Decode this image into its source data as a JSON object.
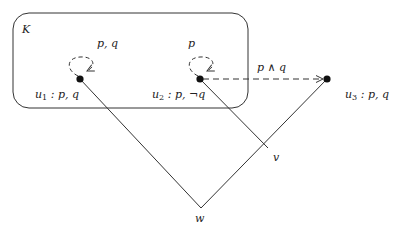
{
  "diagram": {
    "type": "kripke-model",
    "colors": {
      "stroke": "#333333",
      "background": "#ffffff",
      "node": "#111111"
    },
    "region": {
      "label": "K",
      "x": 13,
      "y": 13,
      "w": 235,
      "h": 95,
      "radius": 16
    },
    "nodes": [
      {
        "id": "u1",
        "name": "u",
        "sub": "1",
        "props": ": p, q",
        "x": 80,
        "y": 79,
        "loop_label": "p, q"
      },
      {
        "id": "u2",
        "name": "u",
        "sub": "2",
        "props": ": p, ¬q",
        "x": 200,
        "y": 79,
        "loop_label": "p"
      },
      {
        "id": "u3",
        "name": "u",
        "sub": "3",
        "props": ": p, q",
        "x": 327,
        "y": 79
      },
      {
        "id": "v",
        "name": "v",
        "x": 268,
        "y": 148
      },
      {
        "id": "w",
        "name": "w",
        "x": 201,
        "y": 208
      }
    ],
    "edges": [
      {
        "from": "w",
        "to": "u1",
        "style": "solid"
      },
      {
        "from": "w",
        "to": "u3",
        "style": "solid"
      },
      {
        "from": "v",
        "to": "u2",
        "style": "solid"
      },
      {
        "from": "u2",
        "to": "u3",
        "style": "dashed",
        "arrow": true,
        "label": "p ∧ q"
      },
      {
        "from": "u1",
        "to": "u1",
        "style": "dashed-loop",
        "arrow": true
      },
      {
        "from": "u2",
        "to": "u2",
        "style": "dashed-loop",
        "arrow": true
      }
    ]
  },
  "labels": {
    "K": "K",
    "u1_loop": "p, q",
    "u2_loop": "p",
    "u1_name": "u",
    "u1_sub": "1",
    "u1_props": " : p, q",
    "u2_name": "u",
    "u2_sub": "2",
    "u2_props": " : p, ¬q",
    "u3_name": "u",
    "u3_sub": "3",
    "u3_props": " : p, q",
    "edge_label": "p ∧ q",
    "v": "v",
    "w": "w"
  }
}
